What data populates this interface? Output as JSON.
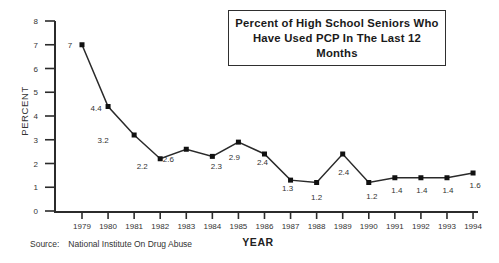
{
  "title_box": {
    "line1": "Percent of High School Seniors Who",
    "line2": "Have Used PCP In The Last 12 Months"
  },
  "axis": {
    "x_label": "YEAR",
    "y_label": "PERCENT"
  },
  "source": {
    "label": "Source:",
    "text": "National Institute On Drug Abuse"
  },
  "chart_data": {
    "type": "line",
    "title": "Percent of High School Seniors Who Have Used PCP In The Last 12 Months",
    "xlabel": "YEAR",
    "ylabel": "PERCENT",
    "x": [
      1979,
      1980,
      1981,
      1982,
      1983,
      1984,
      1985,
      1986,
      1987,
      1988,
      1989,
      1990,
      1991,
      1992,
      1993,
      1994
    ],
    "values": [
      7,
      4.4,
      3.2,
      2.2,
      2.6,
      2.3,
      2.9,
      2.4,
      1.3,
      1.2,
      2.4,
      1.2,
      1.4,
      1.4,
      1.4,
      1.6
    ],
    "point_labels": [
      "7",
      "4.4",
      "3.2",
      "2.2",
      "2.6",
      "2.3",
      "2.9",
      "2.4",
      "1.3",
      "1.2",
      "2.4",
      "1.2",
      "1.4",
      "1.4",
      "1.4",
      "1.6"
    ],
    "ylim": [
      0,
      8
    ],
    "yticks": [
      0,
      1,
      2,
      3,
      4,
      5,
      6,
      7,
      8
    ],
    "marker": "square",
    "grid": "off",
    "legend": "none",
    "line_color": "#2a2a2a",
    "marker_color": "#111111",
    "axis_color": "#2b2b2b",
    "text_color": "#333333"
  }
}
